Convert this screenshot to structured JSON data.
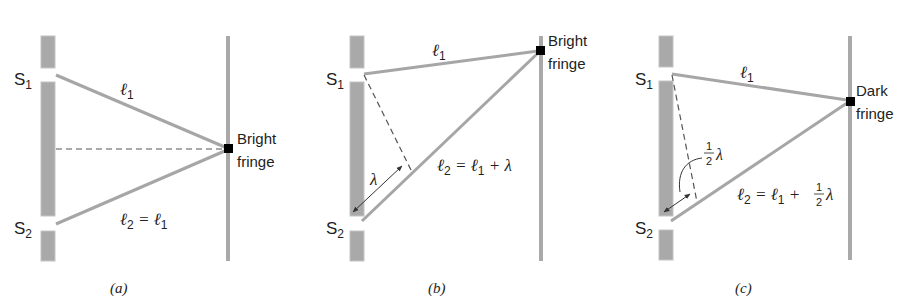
{
  "figure": {
    "colors": {
      "barrier": "#a9a9a9",
      "barrier_edge": "#c4c4c4",
      "ray": "#a6a6a6",
      "dashed": "#555555",
      "fringe_dot": "#000000",
      "text": "#222222"
    },
    "panels": [
      {
        "id": "a",
        "caption": "(a)",
        "slit_top_label": "S",
        "slit_top_sub": "1",
        "slit_bottom_label": "S",
        "slit_bottom_sub": "2",
        "path1_label": "ℓ",
        "path1_sub": "1",
        "path2_label": "ℓ",
        "path2_sub": "2",
        "path2_rhs": " = ℓ",
        "path2_rhs_sub": "1",
        "fringe_line1": "Bright",
        "fringe_line2": "fringe"
      },
      {
        "id": "b",
        "caption": "(b)",
        "slit_top_label": "S",
        "slit_top_sub": "1",
        "slit_bottom_label": "S",
        "slit_bottom_sub": "2",
        "path1_label": "ℓ",
        "path1_sub": "1",
        "path2_label": "ℓ",
        "path2_sub": "2",
        "path2_rhs": " = ℓ",
        "path2_rhs_sub": "1",
        "path2_tail": " + λ",
        "difference_label": "λ",
        "fringe_line1": "Bright",
        "fringe_line2": "fringe"
      },
      {
        "id": "c",
        "caption": "(c)",
        "slit_top_label": "S",
        "slit_top_sub": "1",
        "slit_bottom_label": "S",
        "slit_bottom_sub": "2",
        "path1_label": "ℓ",
        "path1_sub": "1",
        "path2_label": "ℓ",
        "path2_sub": "2",
        "path2_rhs": " = ℓ",
        "path2_rhs_sub": "1",
        "path2_plus": " + ",
        "frac_num": "1",
        "frac_den": "2",
        "lambda": "λ",
        "fringe_line1": "Dark",
        "fringe_line2": "fringe"
      }
    ]
  }
}
